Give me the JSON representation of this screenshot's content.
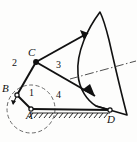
{
  "figure": {
    "type": "kinematic-mechanism-diagram",
    "title": "",
    "background_color": "#fdfdfc",
    "stroke_color": "#111111",
    "image_width": 137,
    "image_height": 142
  },
  "joints": [
    {
      "id": "A",
      "label": "A",
      "x": 31,
      "y": 109,
      "kind": "fixed-pivot-on-ground",
      "label_x": 28,
      "label_y": 112
    },
    {
      "id": "B",
      "label": "B",
      "x": 17,
      "y": 95,
      "kind": "pin-joint",
      "label_x": 4,
      "label_y": 85
    },
    {
      "id": "C",
      "label": "C",
      "x": 36,
      "y": 62,
      "kind": "pin-joint",
      "label_x": 29,
      "label_y": 48
    },
    {
      "id": "D",
      "label": "D",
      "x": 110,
      "y": 110,
      "kind": "fixed-pivot-on-ground",
      "label_x": 108,
      "label_y": 113
    }
  ],
  "links": [
    {
      "number": "1",
      "label": "1",
      "from": "A",
      "to": "B",
      "label_x": 30,
      "label_y": 90,
      "description": "crank AB"
    },
    {
      "number": "2",
      "label": "2",
      "from": "B",
      "to": "C",
      "label_x": 14,
      "label_y": 62,
      "description": "coupler BC"
    },
    {
      "number": "3",
      "label": "3",
      "from": "C",
      "to": "curved-sector",
      "label_x": 57,
      "label_y": 64,
      "description": "link C to curved sector"
    },
    {
      "number": "4",
      "label": "4",
      "from": "A",
      "to": "D",
      "label_x": 57,
      "label_y": 92,
      "description": "ground frame AD"
    }
  ],
  "elements": {
    "circle": {
      "name": "crank-circle",
      "cx": 31,
      "cy": 109,
      "r": 24,
      "style": "dashed"
    },
    "ground_hatching": {
      "name": "ground-hatch",
      "from_x": 31,
      "from_y": 112,
      "to_x": 110,
      "to_y": 112
    },
    "curved_sector": {
      "name": "curved-link-sector",
      "apex_x": 100,
      "apex_y": 12,
      "tip_x": 127,
      "tip_y": 115
    },
    "centerline": {
      "name": "axis-centerline",
      "style": "dash-dot",
      "x1": 70,
      "y1": 79,
      "x2": 136,
      "y2": 62
    },
    "rotation_arrow": {
      "name": "rotation-direction-arrow",
      "x": 14,
      "y": 102
    }
  },
  "labels": {
    "A": "A",
    "B": "B",
    "C": "C",
    "D": "D",
    "one": "1",
    "two": "2",
    "three": "3",
    "four": "4"
  }
}
